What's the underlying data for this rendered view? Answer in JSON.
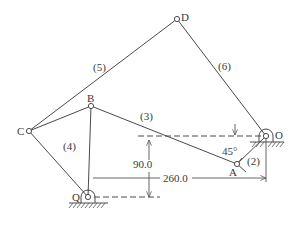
{
  "diagram": {
    "type": "linkage-mechanism",
    "joints": {
      "D": {
        "label": "D"
      },
      "C": {
        "label": "C"
      },
      "B": {
        "label": "B"
      },
      "O": {
        "label": "O"
      },
      "A": {
        "label": "A"
      },
      "Q": {
        "label": "Q"
      }
    },
    "links": {
      "l2": {
        "label": "(2)",
        "connects": [
          "O",
          "A"
        ]
      },
      "l3": {
        "label": "(3)",
        "connects": [
          "B",
          "A"
        ]
      },
      "l4": {
        "label": "(4)",
        "connects": [
          "C",
          "Q"
        ]
      },
      "l5": {
        "label": "(5)",
        "connects": [
          "C",
          "D"
        ]
      },
      "l6": {
        "label": "(6)",
        "connects": [
          "D",
          "O"
        ]
      }
    },
    "dimensions": {
      "vertical": "90.0",
      "horizontal": "260.0",
      "angle": "45°"
    },
    "colors": {
      "line": "#4a4a4a",
      "text": "#3a3a3a",
      "background": "#ffffff"
    }
  }
}
